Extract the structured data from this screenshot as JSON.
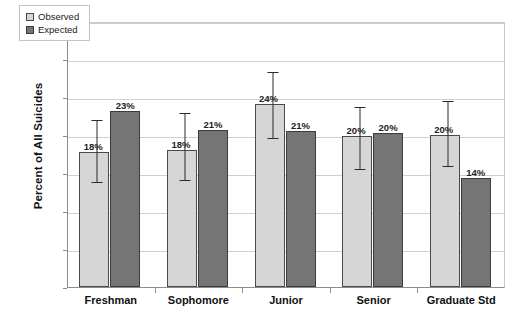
{
  "chart_data": {
    "type": "bar",
    "title": "",
    "xlabel": "",
    "ylabel": "Percent of All Suicides",
    "categories": [
      "Freshman",
      "Sophomore",
      "Junior",
      "Senior",
      "Graduate Std"
    ],
    "ylim": [
      0,
      35
    ],
    "ytick_values": [
      0,
      5,
      10,
      15,
      20,
      25,
      30,
      35
    ],
    "ytick_labels": [
      "0%",
      "5%",
      "10%",
      "15%",
      "20%",
      "25%",
      "30%",
      "35%"
    ],
    "grid": true,
    "legend_position": "top-left-inside",
    "series": [
      {
        "name": "Observed",
        "color": "#d6d6d6",
        "values": [
          17.8,
          18.0,
          24.1,
          19.9,
          20.0
        ],
        "labels": [
          "18%",
          "18%",
          "24%",
          "20%",
          "20%"
        ],
        "error_low": [
          13.9,
          14.2,
          19.7,
          15.7,
          16.0
        ],
        "error_high": [
          22.3,
          23.1,
          28.6,
          24.0,
          24.8
        ]
      },
      {
        "name": "Expected",
        "color": "#757575",
        "values": [
          23.2,
          20.6,
          20.5,
          20.3,
          14.3
        ],
        "labels": [
          "23%",
          "21%",
          "21%",
          "20%",
          "14%"
        ],
        "error_low": [],
        "error_high": []
      }
    ]
  },
  "legend": {
    "items": [
      {
        "label": "Observed",
        "swatch": "observed"
      },
      {
        "label": "Expected",
        "swatch": "expected"
      }
    ]
  },
  "axis": {
    "y_title": "Percent of All Suicides"
  }
}
